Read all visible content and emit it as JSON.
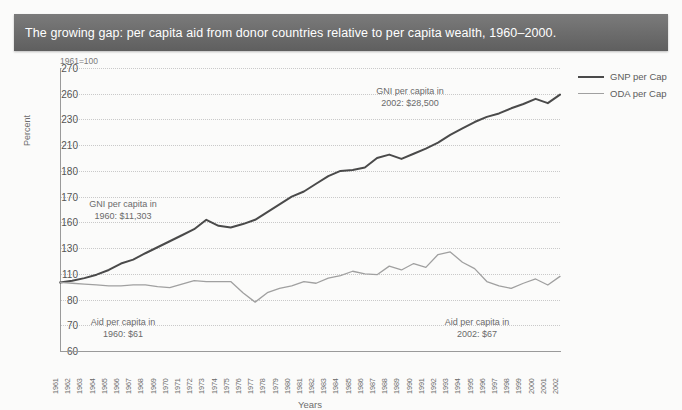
{
  "title": "The growing gap: per capita aid from donor countries relative to per capita wealth, 1960–2000.",
  "base_note": "1961=100",
  "axis": {
    "ylabel": "Percent",
    "xlabel": "Years"
  },
  "legend": {
    "position": "right",
    "items": [
      {
        "label": "GNP per Cap",
        "color": "#4a4a4a"
      },
      {
        "label": "ODA per Cap",
        "color": "#a0a0a0"
      }
    ]
  },
  "annotations": [
    {
      "name": "gni-2002",
      "text": "GNI per capita in\n2002: $28,500"
    },
    {
      "name": "gni-1960",
      "text": "GNI per capita in\n1960: $11,303"
    },
    {
      "name": "aid-1960",
      "text": "Aid per capita in\n1960: $61"
    },
    {
      "name": "aid-2002",
      "text": "Aid per capita in\n2002: $67"
    }
  ],
  "colors": {
    "banner_start": "#7b7b7b",
    "banner_end": "#5f5f5f",
    "gnp_line": "#4a4a4a",
    "oda_line": "#a0a0a0",
    "grid": "#c9c9c9",
    "axis": "#9a9a9a",
    "background": "#fbfbfa"
  },
  "chart_data": {
    "type": "line",
    "title": "The growing gap: per capita aid from donor countries relative to per capita wealth, 1960–2000.",
    "xlabel": "Years",
    "ylabel": "Percent",
    "base_note": "1961=100",
    "grid": true,
    "legend_position": "right",
    "ytick_labels": [
      270,
      260,
      230,
      210,
      180,
      170,
      160,
      130,
      110,
      80,
      70,
      60
    ],
    "ylim": [
      60,
      270
    ],
    "categories": [
      "1961",
      "1962",
      "1963",
      "1964",
      "1965",
      "1966",
      "1967",
      "1968",
      "1969",
      "1970",
      "1971",
      "1972",
      "1973",
      "1974",
      "1975",
      "1976",
      "1977",
      "1978",
      "1979",
      "1980",
      "1981",
      "1982",
      "1983",
      "1984",
      "1985",
      "1986",
      "1987",
      "1988",
      "1989",
      "1990",
      "1991",
      "1992",
      "1993",
      "1994",
      "1995",
      "1996",
      "1997",
      "1998",
      "1999",
      "2000",
      "2001",
      "2002"
    ],
    "series": [
      {
        "name": "GNP per Cap",
        "color": "#4a4a4a",
        "values": [
          100,
          102,
          105,
          109,
          113,
          118,
          121,
          126,
          131,
          138,
          145,
          152,
          161,
          156,
          154,
          158,
          161,
          164,
          167,
          170,
          172,
          175,
          178,
          180,
          181,
          184,
          195,
          199,
          194,
          200,
          206,
          212,
          218,
          223,
          228,
          233,
          237,
          243,
          248,
          254,
          249,
          259
        ]
      },
      {
        "name": "ODA per Cap",
        "color": "#a0a0a0",
        "values": [
          100,
          99,
          98,
          97,
          96,
          96,
          97,
          97,
          95,
          94,
          98,
          102,
          101,
          101,
          101,
          88,
          79,
          88,
          93,
          96,
          101,
          99,
          105,
          108,
          112,
          110,
          109,
          116,
          113,
          118,
          115,
          125,
          127,
          119,
          114,
          101,
          96,
          93,
          99,
          104,
          97,
          107
        ]
      }
    ]
  }
}
